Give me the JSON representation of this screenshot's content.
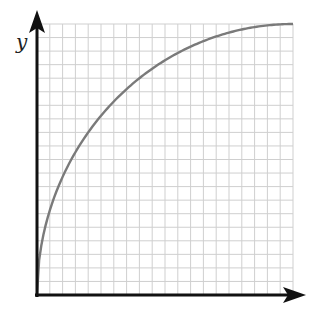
{
  "chart_data": {
    "type": "line",
    "title": "",
    "xlabel": "x",
    "ylabel": "y",
    "grid": true,
    "grid_cells": {
      "x": 20,
      "y": 20
    },
    "xlim": [
      0,
      20
    ],
    "ylim": [
      0,
      20
    ],
    "tick_labels": false,
    "series": [
      {
        "name": "curve",
        "description": "increasing concave curve from origin, saturating to flat maximum at top-right (quarter ellipse)",
        "x": [
          0,
          0.5,
          1,
          2,
          3,
          4,
          5,
          6,
          8,
          10,
          12,
          14,
          16,
          18,
          20
        ],
        "y": [
          0,
          6.2,
          8.7,
          12.0,
          14.3,
          16.0,
          17.3,
          18.3,
          19.6,
          20.0,
          20.0,
          20.0,
          20.0,
          20.0,
          20.0
        ]
      }
    ]
  },
  "labels": {
    "y_axis": "y",
    "x_axis": "x"
  },
  "colors": {
    "axis": "#111111",
    "grid": "#cfcfcf",
    "curve": "#7a7a7a"
  }
}
